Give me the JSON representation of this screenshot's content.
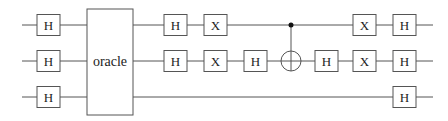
{
  "diagram": {
    "type": "quantum-circuit",
    "colors": {
      "line": "#555555",
      "text": "#222222",
      "background": "#ffffff"
    },
    "wires": [
      {
        "id": "q0",
        "y": 25,
        "x_start": 22,
        "x_end": 433
      },
      {
        "id": "q1",
        "y": 61,
        "x_start": 22,
        "x_end": 433
      },
      {
        "id": "q2",
        "y": 97,
        "x_start": 22,
        "x_end": 433
      }
    ],
    "oracle": {
      "label": "oracle",
      "x": 87,
      "y": 9,
      "width": 46,
      "height": 106,
      "wires": [
        "q0",
        "q1",
        "q2"
      ]
    },
    "gates": [
      {
        "label": "H",
        "wire": 0,
        "x": 37
      },
      {
        "label": "H",
        "wire": 1,
        "x": 37
      },
      {
        "label": "H",
        "wire": 2,
        "x": 37
      },
      {
        "label": "H",
        "wire": 0,
        "x": 164
      },
      {
        "label": "H",
        "wire": 1,
        "x": 164
      },
      {
        "label": "X",
        "wire": 0,
        "x": 204
      },
      {
        "label": "X",
        "wire": 1,
        "x": 204
      },
      {
        "label": "H",
        "wire": 1,
        "x": 244
      },
      {
        "label": "H",
        "wire": 1,
        "x": 315
      },
      {
        "label": "X",
        "wire": 0,
        "x": 353
      },
      {
        "label": "X",
        "wire": 1,
        "x": 353
      },
      {
        "label": "H",
        "wire": 0,
        "x": 393
      },
      {
        "label": "H",
        "wire": 1,
        "x": 393
      },
      {
        "label": "H",
        "wire": 2,
        "x": 393
      }
    ],
    "cnot": {
      "control_wire": 0,
      "target_wire": 1,
      "x": 291,
      "target_radius": 10,
      "control_radius": 2.5
    },
    "gate_size": {
      "width": 23,
      "height": 21
    }
  }
}
